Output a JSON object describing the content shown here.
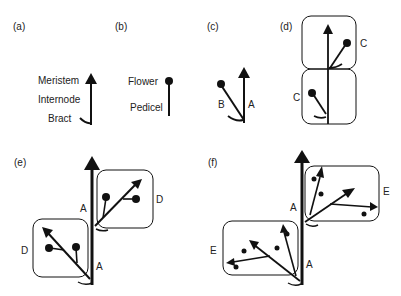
{
  "panels": {
    "a": {
      "label": "(a)",
      "parts": [
        "Meristem",
        "Internode",
        "Bract"
      ]
    },
    "b": {
      "label": "(b)",
      "parts": [
        "Flower",
        "Pedicel"
      ]
    },
    "c": {
      "label": "(c)",
      "branch_labels": [
        "B",
        "A"
      ]
    },
    "d": {
      "label": "(d)",
      "unit_labels": [
        "C",
        "C"
      ]
    },
    "e": {
      "label": "(e)",
      "unit_labels": [
        "D",
        "D"
      ],
      "axis_labels": [
        "A",
        "A"
      ]
    },
    "f": {
      "label": "(f)",
      "unit_labels": [
        "E",
        "E"
      ],
      "axis_labels": [
        "A",
        "A"
      ]
    }
  },
  "colors": {
    "ink": "#111111",
    "background": "#ffffff"
  }
}
